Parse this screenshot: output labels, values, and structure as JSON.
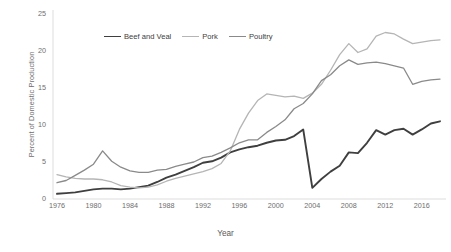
{
  "chart_data": {
    "type": "line",
    "title": "",
    "xlabel": "Year",
    "ylabel": "Percent of Domestic Production",
    "xlim": [
      1976,
      2018
    ],
    "ylim": [
      0,
      25
    ],
    "yticks": [
      0,
      5,
      10,
      15,
      20,
      25
    ],
    "xticks": [
      1976,
      1980,
      1984,
      1988,
      1992,
      1996,
      2000,
      2004,
      2008,
      2012,
      2016
    ],
    "grid": false,
    "legend_position": "top-center",
    "x": [
      1976,
      1977,
      1978,
      1979,
      1980,
      1981,
      1982,
      1983,
      1984,
      1985,
      1986,
      1987,
      1988,
      1989,
      1990,
      1991,
      1992,
      1993,
      1994,
      1995,
      1996,
      1997,
      1998,
      1999,
      2000,
      2001,
      2002,
      2003,
      2004,
      2005,
      2006,
      2007,
      2008,
      2009,
      2010,
      2011,
      2012,
      2013,
      2014,
      2015,
      2016,
      2017,
      2018
    ],
    "series": [
      {
        "name": "Beef and Veal",
        "color": "#3f3f3f",
        "width": 1.9,
        "values": [
          0.7,
          0.8,
          0.9,
          1.1,
          1.3,
          1.4,
          1.4,
          1.3,
          1.4,
          1.6,
          1.8,
          2.3,
          2.9,
          3.3,
          3.8,
          4.3,
          4.9,
          5.1,
          5.6,
          6.3,
          6.7,
          7.0,
          7.2,
          7.6,
          7.9,
          8.0,
          8.5,
          9.4,
          1.5,
          2.7,
          3.7,
          4.5,
          6.3,
          6.2,
          7.6,
          9.3,
          8.7,
          9.3,
          9.5,
          8.7,
          9.4,
          10.2,
          10.5
        ]
      },
      {
        "name": "Pork",
        "color": "#b5b5b5",
        "width": 1.3,
        "values": [
          3.3,
          3.0,
          2.8,
          2.7,
          2.7,
          2.6,
          2.3,
          1.8,
          1.6,
          1.5,
          1.6,
          1.9,
          2.4,
          2.8,
          3.1,
          3.4,
          3.7,
          4.1,
          4.8,
          6.5,
          9.4,
          11.6,
          13.3,
          14.2,
          14.0,
          13.8,
          13.9,
          13.6,
          14.3,
          15.5,
          17.4,
          19.5,
          21.0,
          19.8,
          20.3,
          22.0,
          22.5,
          22.3,
          21.6,
          21.0,
          21.2,
          21.4,
          21.5
        ]
      },
      {
        "name": "Poultry",
        "color": "#8a8a8a",
        "width": 1.3,
        "values": [
          2.2,
          2.5,
          3.2,
          3.9,
          4.7,
          6.5,
          5.1,
          4.3,
          3.8,
          3.6,
          3.6,
          3.9,
          4.0,
          4.4,
          4.7,
          5.0,
          5.6,
          5.8,
          6.3,
          6.9,
          7.6,
          8.0,
          8.0,
          9.0,
          9.8,
          10.7,
          12.2,
          12.9,
          14.2,
          16.0,
          16.8,
          18.0,
          18.8,
          18.2,
          18.4,
          18.5,
          18.3,
          18.0,
          17.7,
          15.5,
          15.9,
          16.1,
          16.2
        ]
      }
    ]
  },
  "legend": {
    "items": [
      {
        "label": "Beef and Veal",
        "color": "#3f3f3f"
      },
      {
        "label": "Pork",
        "color": "#b5b5b5"
      },
      {
        "label": "Poultry",
        "color": "#8a8a8a"
      }
    ]
  },
  "axes": {
    "x_title": "Year",
    "y_title": "Percent of Domestic Production",
    "y_labels": [
      "0",
      "5",
      "10",
      "15",
      "20",
      "25"
    ],
    "x_labels": [
      "1976",
      "1980",
      "1984",
      "1988",
      "1992",
      "1996",
      "2000",
      "2004",
      "2008",
      "2012",
      "2016"
    ]
  },
  "colors": {
    "axis_line": "#d9d9d9",
    "tick_text": "#6e6e6e",
    "background": "#ffffff"
  }
}
